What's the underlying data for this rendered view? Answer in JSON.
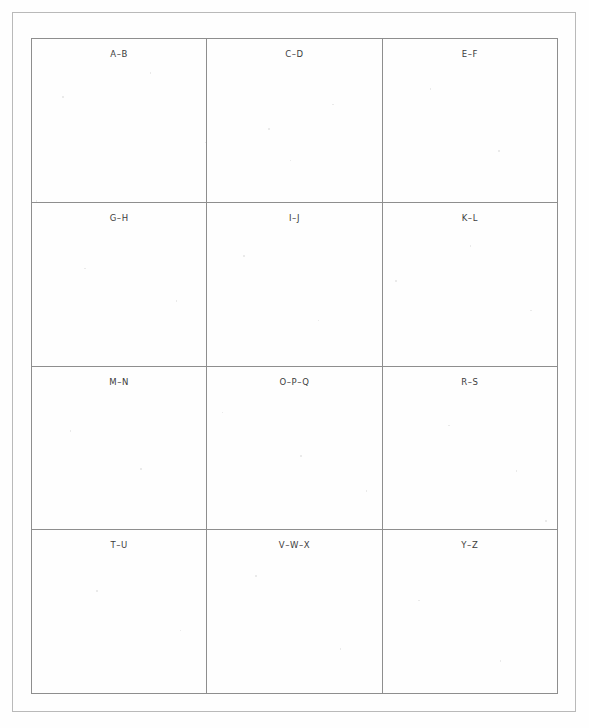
{
  "document": {
    "title": "Alphabet Index Sheet",
    "description": "Blank scanned address-book index page with alphabetical section headings",
    "paper_color": "#fefefe",
    "border_color": "#b9b9b9",
    "rule_color": "#8e8e8e",
    "text_color": "#3c3c3c"
  },
  "page_border": {
    "name": "page-border"
  },
  "index_table": {
    "columns": 3,
    "rows": 4,
    "cells": [
      {
        "label": "A–B"
      },
      {
        "label": "C–D"
      },
      {
        "label": "E–F"
      },
      {
        "label": "G–H"
      },
      {
        "label": "I–J"
      },
      {
        "label": "K–L"
      },
      {
        "label": "M–N"
      },
      {
        "label": "O–P–Q"
      },
      {
        "label": "R–S"
      },
      {
        "label": "T–U"
      },
      {
        "label": "V–W–X"
      },
      {
        "label": "Y–Z"
      }
    ]
  }
}
